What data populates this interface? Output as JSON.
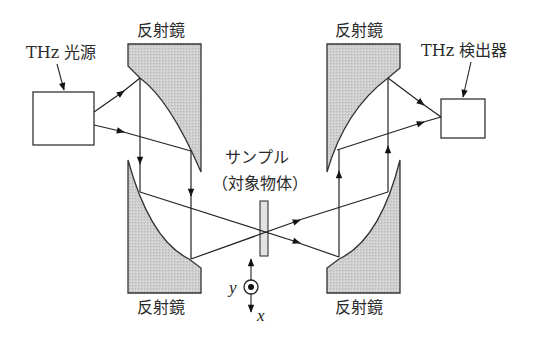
{
  "diagram": {
    "labels": {
      "source": "THz 光源",
      "detector": "THz 検出器",
      "mirror_top_left": "反射鏡",
      "mirror_top_right": "反射鏡",
      "mirror_bottom_left": "反射鏡",
      "mirror_bottom_right": "反射鏡",
      "sample_line1": "サンプル",
      "sample_line2": "（対象物体）",
      "axis_y": "y",
      "axis_x": "x"
    },
    "nodes": [
      {
        "id": "source",
        "label": "THz 光源",
        "shape": "rectangle"
      },
      {
        "id": "mirror_tl",
        "label": "反射鏡",
        "shape": "parabolic-mirror"
      },
      {
        "id": "mirror_bl",
        "label": "反射鏡",
        "shape": "parabolic-mirror"
      },
      {
        "id": "sample",
        "label": "サンプル（対象物体）",
        "shape": "slab"
      },
      {
        "id": "mirror_br",
        "label": "反射鏡",
        "shape": "parabolic-mirror"
      },
      {
        "id": "mirror_tr",
        "label": "反射鏡",
        "shape": "parabolic-mirror"
      },
      {
        "id": "detector",
        "label": "THz 検出器",
        "shape": "rectangle"
      }
    ],
    "edges": [
      {
        "from": "source",
        "to": "mirror_tl",
        "kind": "beam"
      },
      {
        "from": "mirror_tl",
        "to": "mirror_bl",
        "kind": "collimated-beam"
      },
      {
        "from": "mirror_bl",
        "to": "sample",
        "kind": "focused-beam"
      },
      {
        "from": "sample",
        "to": "mirror_br",
        "kind": "diverging-beam"
      },
      {
        "from": "mirror_br",
        "to": "mirror_tr",
        "kind": "collimated-beam"
      },
      {
        "from": "mirror_tr",
        "to": "detector",
        "kind": "focused-beam"
      }
    ],
    "colors": {
      "mirror_fill": "#c8c8c8",
      "line": "#222222",
      "sample_fill": "#e2e2e2",
      "background": "#ffffff"
    }
  }
}
